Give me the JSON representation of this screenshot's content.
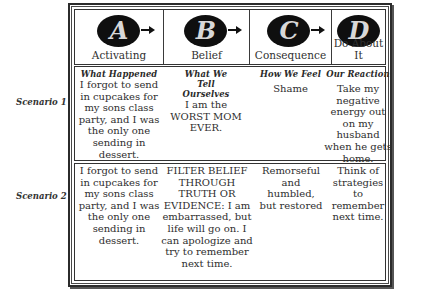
{
  "header": {
    "columns": [
      {
        "letter": "A",
        "label": "Activating",
        "icon": "letter-a-badge-icon"
      },
      {
        "letter": "B",
        "label": "Belief",
        "icon": "letter-b-badge-icon"
      },
      {
        "letter": "C",
        "label": "Consequence",
        "icon": "letter-c-badge-icon"
      },
      {
        "letter": "D",
        "label": "Do About It",
        "icon": "letter-d-badge-icon"
      }
    ]
  },
  "column_headings": {
    "a": "What Happened",
    "b": "What We Tell Ourselves",
    "c": "How We Feel",
    "d": "Our Reaction"
  },
  "scenarios": [
    {
      "label": "Scenario 1",
      "a": "I forgot to send in cupcakes for my sons class party, and I was the only one sending in dessert.",
      "b": "I am the WORST MOM EVER.",
      "c": "Shame",
      "d": "Take my negative energy out on my husband when he gets home."
    },
    {
      "label": "Scenario 2",
      "a": "I forgot to send in cupcakes for my sons class party, and I was the only one sending in dessert.",
      "b": "FILTER BELIEF THROUGH TRUTH OR EVIDENCE: I am embarrassed, but life will go on. I can apologize and try to remember next time.",
      "c": "Remorseful and humbled, but restored",
      "d": "Think of strategies to remember next time."
    }
  ],
  "colors": {
    "border": "#2b2b2b",
    "badge": "#0f0f0f",
    "badge_letter": "#d8d8d8",
    "text": "#2e2e2e"
  }
}
